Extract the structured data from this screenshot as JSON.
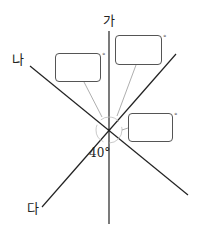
{
  "diagram": {
    "labels": {
      "ga": "가",
      "na": "나",
      "da": "다"
    },
    "given_angle": "40°",
    "boxes": [
      {
        "id": "left",
        "value": "",
        "unit": "°"
      },
      {
        "id": "top-right",
        "value": "",
        "unit": "°"
      },
      {
        "id": "right",
        "value": "",
        "unit": "°"
      }
    ],
    "colors": {
      "line": "#222222",
      "box_border": "#555555",
      "pointer": "#999999"
    }
  }
}
